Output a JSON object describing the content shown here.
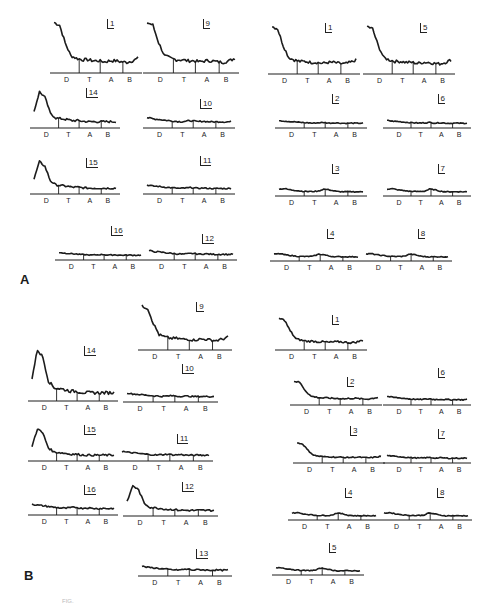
{
  "figure": {
    "panels": [
      {
        "letter": "A",
        "label_pos": [
          20,
          278
        ]
      },
      {
        "letter": "B",
        "label_pos": [
          24,
          572
        ]
      }
    ],
    "band_labels": [
      "D",
      "T",
      "A",
      "B"
    ],
    "caption": "FIG."
  },
  "chart_data": {
    "type": "line",
    "xlabel": "Frequency band",
    "x_categories": [
      "D",
      "T",
      "A",
      "B"
    ],
    "band_names": {
      "D": "delta",
      "T": "theta",
      "A": "alpha",
      "B": "beta"
    },
    "series_shapes": {
      "decay": [
        0.95,
        0.9,
        0.55,
        0.3,
        0.25,
        0.22,
        0.22,
        0.2,
        0.2,
        0.18,
        0.2,
        0.2,
        0.18,
        0.17,
        0.2,
        0.25
      ],
      "peak": [
        0.4,
        0.95,
        0.8,
        0.35,
        0.22,
        0.2,
        0.18,
        0.15,
        0.15,
        0.13,
        0.12,
        0.12,
        0.12,
        0.12,
        0.12,
        0.12
      ],
      "flat": [
        0.35,
        0.3,
        0.28,
        0.25,
        0.22,
        0.2,
        0.18,
        0.2,
        0.22,
        0.18,
        0.2,
        0.18,
        0.17,
        0.18,
        0.17,
        0.18
      ],
      "alpha_bump": [
        0.35,
        0.38,
        0.3,
        0.25,
        0.2,
        0.18,
        0.18,
        0.2,
        0.35,
        0.3,
        0.2,
        0.16,
        0.16,
        0.16,
        0.16,
        0.16
      ]
    },
    "panels": {
      "A": [
        {
          "id": "1",
          "x": 50,
          "y": 18,
          "w": 92,
          "h": 55,
          "shape": "decay"
        },
        {
          "id": "9",
          "x": 143,
          "y": 18,
          "w": 96,
          "h": 55,
          "shape": "decay"
        },
        {
          "id": "1",
          "x": 268,
          "y": 22,
          "w": 92,
          "h": 52,
          "shape": "decay"
        },
        {
          "id": "5",
          "x": 363,
          "y": 22,
          "w": 92,
          "h": 52,
          "shape": "decay"
        },
        {
          "id": "14",
          "x": 30,
          "y": 88,
          "w": 90,
          "h": 40,
          "shape": "peak"
        },
        {
          "id": "10",
          "x": 143,
          "y": 100,
          "w": 92,
          "h": 28,
          "shape": "flat"
        },
        {
          "id": "2",
          "x": 275,
          "y": 108,
          "w": 92,
          "h": 20,
          "shape": "flat"
        },
        {
          "id": "6",
          "x": 383,
          "y": 108,
          "w": 88,
          "h": 20,
          "shape": "flat"
        },
        {
          "id": "15",
          "x": 30,
          "y": 158,
          "w": 90,
          "h": 36,
          "shape": "peak"
        },
        {
          "id": "11",
          "x": 143,
          "y": 170,
          "w": 92,
          "h": 24,
          "shape": "flat"
        },
        {
          "id": "3",
          "x": 275,
          "y": 178,
          "w": 92,
          "h": 18,
          "shape": "alpha_bump"
        },
        {
          "id": "7",
          "x": 383,
          "y": 178,
          "w": 88,
          "h": 18,
          "shape": "alpha_bump"
        },
        {
          "id": "16",
          "x": 55,
          "y": 240,
          "w": 90,
          "h": 20,
          "shape": "flat"
        },
        {
          "id": "12",
          "x": 145,
          "y": 235,
          "w": 92,
          "h": 25,
          "shape": "flat"
        },
        {
          "id": "4",
          "x": 270,
          "y": 243,
          "w": 92,
          "h": 18,
          "shape": "alpha_bump"
        },
        {
          "id": "8",
          "x": 362,
          "y": 243,
          "w": 90,
          "h": 18,
          "shape": "alpha_bump"
        }
      ],
      "B": [
        {
          "id": "9",
          "x": 138,
          "y": 302,
          "w": 94,
          "h": 48,
          "shape": "decay"
        },
        {
          "id": "1",
          "x": 275,
          "y": 315,
          "w": 92,
          "h": 35,
          "shape": "decay"
        },
        {
          "id": "14",
          "x": 28,
          "y": 345,
          "w": 90,
          "h": 56,
          "shape": "peak"
        },
        {
          "id": "10",
          "x": 123,
          "y": 378,
          "w": 95,
          "h": 24,
          "shape": "flat"
        },
        {
          "id": "2",
          "x": 290,
          "y": 378,
          "w": 92,
          "h": 27,
          "shape": "decay"
        },
        {
          "id": "6",
          "x": 383,
          "y": 382,
          "w": 88,
          "h": 23,
          "shape": "flat"
        },
        {
          "id": "15",
          "x": 28,
          "y": 425,
          "w": 90,
          "h": 36,
          "shape": "peak"
        },
        {
          "id": "11",
          "x": 118,
          "y": 435,
          "w": 95,
          "h": 26,
          "shape": "flat"
        },
        {
          "id": "3",
          "x": 293,
          "y": 440,
          "w": 92,
          "h": 23,
          "shape": "decay"
        },
        {
          "id": "7",
          "x": 383,
          "y": 443,
          "w": 88,
          "h": 20,
          "shape": "flat"
        },
        {
          "id": "16",
          "x": 28,
          "y": 485,
          "w": 90,
          "h": 30,
          "shape": "flat"
        },
        {
          "id": "12",
          "x": 123,
          "y": 482,
          "w": 95,
          "h": 34,
          "shape": "peak"
        },
        {
          "id": "4",
          "x": 288,
          "y": 502,
          "w": 92,
          "h": 18,
          "shape": "alpha_bump"
        },
        {
          "id": "8",
          "x": 380,
          "y": 502,
          "w": 92,
          "h": 18,
          "shape": "alpha_bump"
        },
        {
          "id": "13",
          "x": 138,
          "y": 550,
          "w": 94,
          "h": 26,
          "shape": "flat"
        },
        {
          "id": "5",
          "x": 272,
          "y": 557,
          "w": 92,
          "h": 18,
          "shape": "alpha_bump"
        }
      ]
    },
    "grid": false,
    "legend": "none"
  }
}
